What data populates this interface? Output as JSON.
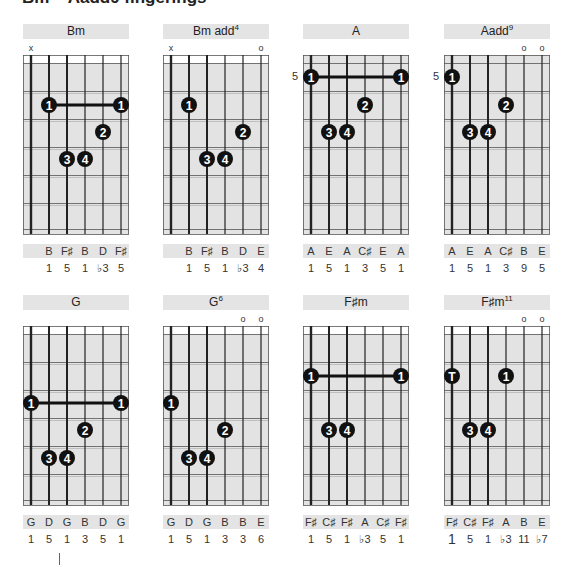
{
  "heading": "Bm – Aadd9 fingerings",
  "strings": 6,
  "colors": {
    "fretboard": "#e3e3e3",
    "nut_band": "#ffffff",
    "title_bar": "#e4e4e4",
    "dot": "#111111",
    "line": "#222222"
  },
  "chords": [
    {
      "name": "Bm",
      "sup": "",
      "col": 0,
      "row": 0,
      "marks": [
        "x",
        "",
        "",
        "",
        "",
        ""
      ],
      "position": "",
      "dots": [
        {
          "string": 1,
          "fret": 2,
          "label": "1"
        },
        {
          "string": 5,
          "fret": 2,
          "label": "1"
        },
        {
          "string": 4,
          "fret": 3,
          "label": "2"
        },
        {
          "string": 2,
          "fret": 4,
          "label": "3"
        },
        {
          "string": 3,
          "fret": 4,
          "label": "4"
        }
      ],
      "barre": {
        "from": 1,
        "to": 5,
        "fret": 2
      },
      "notes": [
        "",
        "B",
        "F♯",
        "B",
        "D",
        "F♯"
      ],
      "intervals": [
        "",
        "1",
        "5",
        "1",
        "♭3",
        "5"
      ]
    },
    {
      "name": "Bm add",
      "sup": "4",
      "col": 1,
      "row": 0,
      "marks": [
        "x",
        "",
        "",
        "",
        "",
        "o"
      ],
      "position": "",
      "dots": [
        {
          "string": 1,
          "fret": 2,
          "label": "1"
        },
        {
          "string": 4,
          "fret": 3,
          "label": "2"
        },
        {
          "string": 2,
          "fret": 4,
          "label": "3"
        },
        {
          "string": 3,
          "fret": 4,
          "label": "4"
        }
      ],
      "barre": null,
      "notes": [
        "",
        "B",
        "F♯",
        "B",
        "D",
        "E"
      ],
      "intervals": [
        "",
        "1",
        "5",
        "1",
        "♭3",
        "4"
      ]
    },
    {
      "name": "A",
      "sup": "",
      "col": 2,
      "row": 0,
      "marks": [
        "",
        "",
        "",
        "",
        "",
        ""
      ],
      "position": "5",
      "dots": [
        {
          "string": 0,
          "fret": 1,
          "label": "1"
        },
        {
          "string": 5,
          "fret": 1,
          "label": "1"
        },
        {
          "string": 3,
          "fret": 2,
          "label": "2"
        },
        {
          "string": 1,
          "fret": 3,
          "label": "3"
        },
        {
          "string": 2,
          "fret": 3,
          "label": "4"
        }
      ],
      "barre": {
        "from": 0,
        "to": 5,
        "fret": 1
      },
      "notes": [
        "A",
        "E",
        "A",
        "C♯",
        "E",
        "A"
      ],
      "intervals": [
        "1",
        "5",
        "1",
        "3",
        "5",
        "1"
      ]
    },
    {
      "name": "Aadd",
      "sup": "9",
      "col": 3,
      "row": 0,
      "marks": [
        "",
        "",
        "",
        "",
        "o",
        "o"
      ],
      "position": "5",
      "dots": [
        {
          "string": 0,
          "fret": 1,
          "label": "1"
        },
        {
          "string": 3,
          "fret": 2,
          "label": "2"
        },
        {
          "string": 1,
          "fret": 3,
          "label": "3"
        },
        {
          "string": 2,
          "fret": 3,
          "label": "4"
        }
      ],
      "barre": null,
      "notes": [
        "A",
        "E",
        "A",
        "C♯",
        "B",
        "E"
      ],
      "intervals": [
        "1",
        "5",
        "1",
        "3",
        "9",
        "5"
      ]
    },
    {
      "name": "G",
      "sup": "",
      "col": 0,
      "row": 1,
      "marks": [
        "",
        "",
        "",
        "",
        "",
        ""
      ],
      "position": "",
      "dots": [
        {
          "string": 0,
          "fret": 3,
          "label": "1"
        },
        {
          "string": 5,
          "fret": 3,
          "label": "1"
        },
        {
          "string": 3,
          "fret": 4,
          "label": "2"
        },
        {
          "string": 1,
          "fret": 5,
          "label": "3"
        },
        {
          "string": 2,
          "fret": 5,
          "label": "4"
        }
      ],
      "barre": {
        "from": 0,
        "to": 5,
        "fret": 3
      },
      "notes": [
        "G",
        "D",
        "G",
        "B",
        "D",
        "G"
      ],
      "intervals": [
        "1",
        "5",
        "1",
        "3",
        "5",
        "1"
      ]
    },
    {
      "name": "G",
      "sup": "6",
      "col": 1,
      "row": 1,
      "marks": [
        "",
        "",
        "",
        "",
        "o",
        "o"
      ],
      "position": "",
      "dots": [
        {
          "string": 0,
          "fret": 3,
          "label": "1"
        },
        {
          "string": 3,
          "fret": 4,
          "label": "2"
        },
        {
          "string": 1,
          "fret": 5,
          "label": "3"
        },
        {
          "string": 2,
          "fret": 5,
          "label": "4"
        }
      ],
      "barre": null,
      "notes": [
        "G",
        "D",
        "G",
        "B",
        "B",
        "E"
      ],
      "intervals": [
        "1",
        "5",
        "1",
        "3",
        "3",
        "6"
      ]
    },
    {
      "name": "F♯m",
      "sup": "",
      "col": 2,
      "row": 1,
      "marks": [
        "",
        "",
        "",
        "",
        "",
        ""
      ],
      "position": "",
      "dots": [
        {
          "string": 0,
          "fret": 2,
          "label": "1"
        },
        {
          "string": 5,
          "fret": 2,
          "label": "1"
        },
        {
          "string": 1,
          "fret": 4,
          "label": "3"
        },
        {
          "string": 2,
          "fret": 4,
          "label": "4"
        }
      ],
      "barre": {
        "from": 0,
        "to": 5,
        "fret": 2
      },
      "notes": [
        "F♯",
        "C♯",
        "F♯",
        "A",
        "C♯",
        "F♯"
      ],
      "intervals": [
        "1",
        "5",
        "1",
        "♭3",
        "5",
        "1"
      ]
    },
    {
      "name": "F♯m",
      "sup": "11",
      "col": 3,
      "row": 1,
      "marks": [
        "",
        "",
        "",
        "",
        "o",
        "o"
      ],
      "position": "",
      "dots": [
        {
          "string": 0,
          "fret": 2,
          "label": "T"
        },
        {
          "string": 3,
          "fret": 2,
          "label": "1"
        },
        {
          "string": 1,
          "fret": 4,
          "label": "3"
        },
        {
          "string": 2,
          "fret": 4,
          "label": "4"
        }
      ],
      "barre": null,
      "notes": [
        "F♯",
        "C♯",
        "F♯",
        "A",
        "B",
        "E"
      ],
      "intervals": [
        "1",
        "5",
        "1",
        "♭3",
        "11",
        "♭7"
      ],
      "big_first_interval": true
    }
  ]
}
